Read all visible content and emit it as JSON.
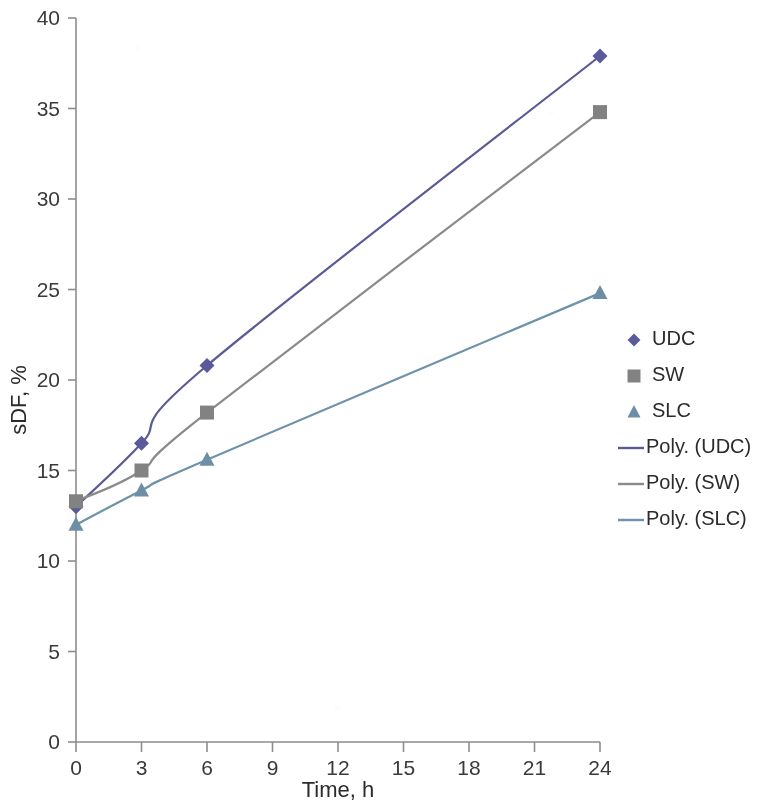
{
  "chart_data": {
    "type": "scatter",
    "title": "",
    "subtitle": "",
    "xlabel": "Time, h",
    "ylabel": "sDF, %",
    "x": [
      0,
      3,
      6,
      24
    ],
    "x_ticks": [
      "0",
      "3",
      "6",
      "9",
      "12",
      "15",
      "18",
      "21",
      "24"
    ],
    "x_tick_values": [
      0,
      3,
      6,
      9,
      12,
      15,
      18,
      21,
      24
    ],
    "y_ticks": [
      "0",
      "5",
      "10",
      "15",
      "20",
      "25",
      "30",
      "35",
      "40"
    ],
    "y_tick_values": [
      0,
      5,
      10,
      15,
      20,
      25,
      30,
      35,
      40
    ],
    "ylim": [
      0,
      40
    ],
    "xlim": [
      0,
      24
    ],
    "grid": false,
    "legend_position": "right",
    "series": [
      {
        "name": "UDC",
        "marker": "diamond",
        "color": "#5b5b9b",
        "line_color": "#5a5a96",
        "values": [
          13.0,
          16.5,
          20.8,
          37.9
        ],
        "trend_label": "Poly. (UDC)"
      },
      {
        "name": "SW",
        "marker": "square",
        "color": "#828282",
        "line_color": "#8a8a8a",
        "values": [
          13.3,
          15.0,
          18.2,
          34.8
        ],
        "trend_label": "Poly. (SW)"
      },
      {
        "name": "SLC",
        "marker": "triangle",
        "color": "#6e8ea6",
        "line_color": "#6d93a8",
        "values": [
          12.0,
          13.9,
          15.6,
          24.8
        ],
        "trend_label": "Poly. (SLC)"
      }
    ],
    "annotations": []
  },
  "axes": {
    "y_title": "sDF, %",
    "x_title": "Time, h",
    "y_labels": [
      "40",
      "35",
      "30",
      "25",
      "20",
      "15",
      "10",
      "5",
      "0"
    ],
    "x_labels": [
      "0",
      "3",
      "6",
      "9",
      "12",
      "15",
      "18",
      "21",
      "24"
    ]
  },
  "legend": {
    "items": [
      {
        "label": "UDC",
        "kind": "marker",
        "marker": "diamond",
        "color": "#5b5b9b"
      },
      {
        "label": "SW",
        "kind": "marker",
        "marker": "square",
        "color": "#828282"
      },
      {
        "label": "SLC",
        "kind": "marker",
        "marker": "triangle",
        "color": "#6e8ea6"
      },
      {
        "label": "Poly. (UDC)",
        "kind": "line",
        "marker": "line",
        "color": "#5a5a96"
      },
      {
        "label": "Poly. (SW)",
        "kind": "line",
        "marker": "line",
        "color": "#8a8a8a"
      },
      {
        "label": "Poly. (SLC)",
        "kind": "line",
        "marker": "line",
        "color": "#6d93a8"
      }
    ]
  },
  "colors": {
    "axis": "#8d8d8d",
    "text": "#2b2b2b",
    "background": "#ffffff",
    "udc": "#5b5b9b",
    "sw": "#828282",
    "slc": "#6e8ea6"
  }
}
